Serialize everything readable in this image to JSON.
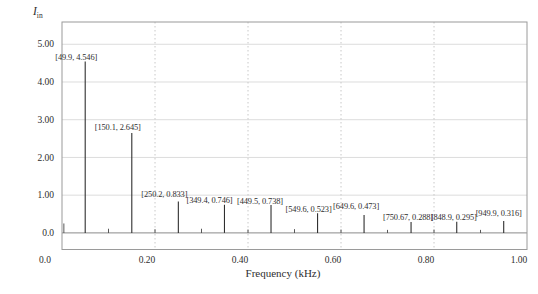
{
  "figure": {
    "y_axis_symbol": "I",
    "y_axis_subscript": "in"
  },
  "chart_data": {
    "type": "bar",
    "subtype": "frequency-spectrum-stem",
    "title": "",
    "xlabel": "Frequency (kHz)",
    "ylabel": "I_in",
    "xlim": [
      0,
      1.0
    ],
    "ylim": [
      -0.44,
      5.59
    ],
    "grid": {
      "horizontal": "solid",
      "vertical": "dotted"
    },
    "legend": "none",
    "plot_box": {
      "left": 62,
      "top": 22,
      "width": 465,
      "height": 227.5
    },
    "x_ticks": [
      {
        "label": "0.0",
        "x": 0.0,
        "dx": -17
      },
      {
        "label": "0.20",
        "x": 0.2,
        "dx": -8
      },
      {
        "label": "0.40",
        "x": 0.4,
        "dx": -8
      },
      {
        "label": "0.60",
        "x": 0.6,
        "dx": -8
      },
      {
        "label": "0.80",
        "x": 0.8,
        "dx": -8
      },
      {
        "label": "1.00",
        "x": 1.0,
        "dx": -8
      }
    ],
    "y_ticks": [
      {
        "label": "0.0",
        "v": 0
      },
      {
        "label": "1.00",
        "v": 1
      },
      {
        "label": "2.00",
        "v": 2
      },
      {
        "label": "3.00",
        "v": 3
      },
      {
        "label": "4.00",
        "v": 4
      },
      {
        "label": "5.00",
        "v": 5
      }
    ],
    "peaks": [
      {
        "x_khz": 0.0499,
        "value": 4.546,
        "label": "[49.9, 4.546]",
        "label_dx": -9,
        "label_gap": 1.5
      },
      {
        "x_khz": 0.1501,
        "value": 2.645,
        "label": "[150.1, 2.645]",
        "label_dx": -14,
        "label_gap": 3
      },
      {
        "x_khz": 0.2502,
        "value": 0.833,
        "label": "[250.2, 0.833]",
        "label_dx": -14,
        "label_gap": 4
      },
      {
        "x_khz": 0.3494,
        "value": 0.746,
        "label": "[349.4, 0.746]",
        "label_dx": -15,
        "label_gap": 1.5
      },
      {
        "x_khz": 0.4495,
        "value": 0.738,
        "label": "[449.5, 0.738]",
        "label_dx": -11,
        "label_gap": 1.5
      },
      {
        "x_khz": 0.5496,
        "value": 0.523,
        "label": "[549.6, 0.523]",
        "label_dx": -9,
        "label_gap": 1.5
      },
      {
        "x_khz": 0.6496,
        "value": 0.473,
        "label": "[649.6, 0.473]",
        "label_dx": -8,
        "label_gap": 6.5
      },
      {
        "x_khz": 0.75067,
        "value": 0.288,
        "label": "[750.67, 0.288]",
        "label_dx": -3,
        "label_gap": 2.5
      },
      {
        "x_khz": 0.8489,
        "value": 0.295,
        "label": "[848.9, 0.295]",
        "label_dx": -3,
        "label_gap": 2
      },
      {
        "x_khz": 0.9499,
        "value": 0.316,
        "label": "[949.9, 0.316]",
        "label_dx": -5,
        "label_gap": 4.5
      }
    ],
    "minor_spurs": [
      {
        "x_khz": 0.004,
        "value": 0.25
      },
      {
        "x_khz": 0.1,
        "value": 0.11
      },
      {
        "x_khz": 0.2,
        "value": 0.1
      },
      {
        "x_khz": 0.3,
        "value": 0.11
      },
      {
        "x_khz": 0.4,
        "value": 0.09
      },
      {
        "x_khz": 0.5,
        "value": 0.1
      },
      {
        "x_khz": 0.6,
        "value": 0.09
      },
      {
        "x_khz": 0.7,
        "value": 0.08
      },
      {
        "x_khz": 0.8,
        "value": 0.09
      },
      {
        "x_khz": 0.9,
        "value": 0.08
      }
    ],
    "colors": {
      "stem": "#2f2f2f",
      "grid_h": "#dcdcdc",
      "grid_v": "#c8c8c8",
      "border": "#9a9a9a",
      "baseline": "#7d7d7d",
      "text": "#2e2e2e",
      "background": "#ffffff"
    }
  }
}
